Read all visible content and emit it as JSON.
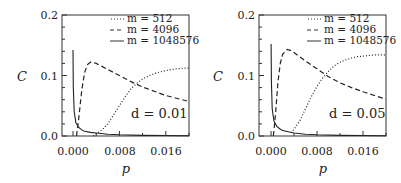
{
  "chart_data": [
    {
      "type": "line",
      "title": "",
      "annotation": "d = 0.01",
      "xlabel": "p",
      "ylabel": "C",
      "xlim": [
        -0.0019,
        0.02
      ],
      "ylim": [
        0.0,
        0.2
      ],
      "xticks": [
        "0.000",
        "0.008",
        "0.016"
      ],
      "yticks": [
        "0.0",
        "0.1",
        "0.2"
      ],
      "grid": false,
      "legend_position": "upper right",
      "series": [
        {
          "name": "m = 512",
          "style": "dotted",
          "x": [
            0.0035,
            0.005,
            0.006,
            0.007,
            0.008,
            0.009,
            0.01,
            0.011,
            0.012,
            0.013,
            0.014,
            0.015,
            0.016,
            0.017,
            0.018,
            0.019,
            0.02
          ],
          "y": [
            0.0,
            0.01,
            0.02,
            0.035,
            0.05,
            0.065,
            0.078,
            0.087,
            0.094,
            0.099,
            0.103,
            0.106,
            0.108,
            0.11,
            0.111,
            0.112,
            0.112
          ]
        },
        {
          "name": "m = 4096",
          "style": "dashed",
          "x": [
            0.0006,
            0.001,
            0.0015,
            0.002,
            0.0025,
            0.003,
            0.0033,
            0.004,
            0.005,
            0.006,
            0.008,
            0.01,
            0.012,
            0.014,
            0.016,
            0.018,
            0.02
          ],
          "y": [
            0.0,
            0.03,
            0.075,
            0.105,
            0.118,
            0.122,
            0.122,
            0.12,
            0.115,
            0.11,
            0.1,
            0.09,
            0.081,
            0.074,
            0.067,
            0.062,
            0.057
          ]
        },
        {
          "name": "m = 1048576",
          "style": "solid",
          "x": [
            0.0,
            5e-05,
            0.0002,
            0.0005,
            0.001,
            0.0015,
            0.002,
            0.003,
            0.004,
            0.006,
            0.008,
            0.012,
            0.016,
            0.02
          ],
          "y": [
            0.142,
            0.08,
            0.04,
            0.022,
            0.014,
            0.01,
            0.008,
            0.006,
            0.005,
            0.003,
            0.002,
            0.001,
            0.0008,
            0.0005
          ]
        }
      ]
    },
    {
      "type": "line",
      "title": "",
      "annotation": "d = 0.05",
      "xlabel": "p",
      "ylabel": "C",
      "xlim": [
        -0.0021,
        0.02
      ],
      "ylim": [
        0.0,
        0.2
      ],
      "xticks": [
        "0.000",
        "0.008",
        "0.016"
      ],
      "yticks": [
        "0.0",
        "0.1",
        "0.2"
      ],
      "grid": false,
      "legend_position": "upper right",
      "series": [
        {
          "name": "m = 512",
          "style": "dotted",
          "x": [
            0.0035,
            0.005,
            0.006,
            0.007,
            0.008,
            0.009,
            0.01,
            0.011,
            0.012,
            0.013,
            0.014,
            0.015,
            0.016,
            0.017,
            0.018,
            0.019,
            0.02
          ],
          "y": [
            0.005,
            0.025,
            0.045,
            0.065,
            0.082,
            0.096,
            0.107,
            0.116,
            0.122,
            0.126,
            0.129,
            0.131,
            0.132,
            0.133,
            0.134,
            0.134,
            0.134
          ]
        },
        {
          "name": "m = 4096",
          "style": "dashed",
          "x": [
            0.0004,
            0.0008,
            0.0012,
            0.0016,
            0.002,
            0.0028,
            0.0035,
            0.005,
            0.006,
            0.008,
            0.01,
            0.012,
            0.014,
            0.016,
            0.018,
            0.02
          ],
          "y": [
            0.0,
            0.04,
            0.09,
            0.12,
            0.135,
            0.143,
            0.141,
            0.131,
            0.124,
            0.111,
            0.098,
            0.088,
            0.08,
            0.073,
            0.067,
            0.061
          ]
        },
        {
          "name": "m = 1048576",
          "style": "solid",
          "x": [
            0.0,
            5e-05,
            0.0002,
            0.0005,
            0.001,
            0.0015,
            0.002,
            0.003,
            0.004,
            0.006,
            0.008,
            0.012,
            0.016,
            0.02
          ],
          "y": [
            0.152,
            0.09,
            0.045,
            0.025,
            0.016,
            0.012,
            0.009,
            0.007,
            0.005,
            0.003,
            0.002,
            0.001,
            0.0008,
            0.0005
          ]
        }
      ]
    }
  ],
  "panels": [
    {
      "ylabel": "C",
      "xlabel": "p",
      "annotation": "d = 0.01",
      "yticks": [
        "0.2",
        "0.1",
        "0.0"
      ],
      "xticks": [
        "0.000",
        "0.008",
        "0.016"
      ],
      "legend": [
        "m = 512",
        "m = 4096",
        "m = 1048576"
      ]
    },
    {
      "ylabel": "C",
      "xlabel": "p",
      "annotation": "d = 0.05",
      "yticks": [
        "0.2",
        "0.1",
        "0.0"
      ],
      "xticks": [
        "0.000",
        "0.008",
        "0.016"
      ],
      "legend": [
        "m = 512",
        "m = 4096",
        "m = 1048576"
      ]
    }
  ]
}
